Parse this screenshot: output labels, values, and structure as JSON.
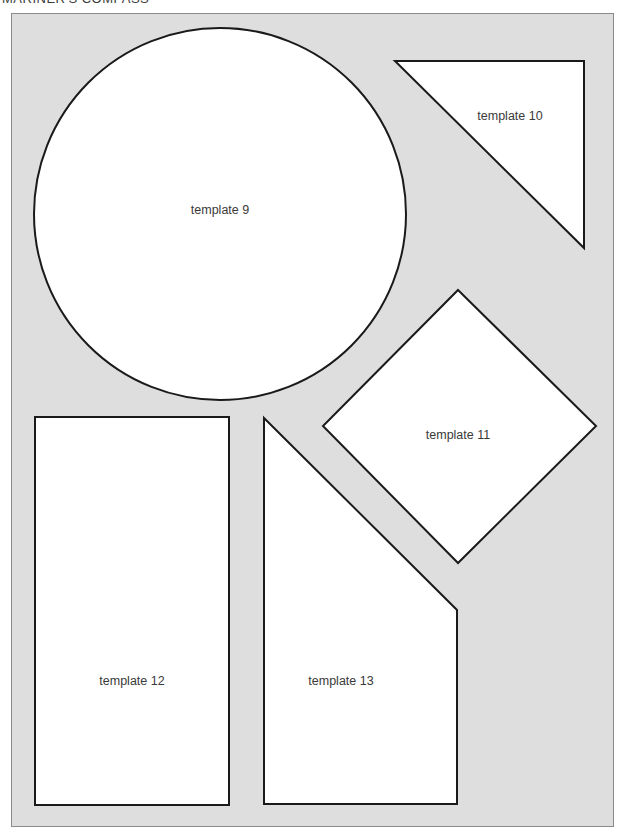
{
  "header": {
    "title": "MARINER'S COMPASS"
  },
  "colors": {
    "panel_background": "#dedede",
    "shape_fill": "#ffffff",
    "shape_stroke": "#1a1a1a",
    "label_text": "#3a3a3a"
  },
  "templates": [
    {
      "id": "template-9",
      "label": "template 9",
      "shape": "circle"
    },
    {
      "id": "template-10",
      "label": "template 10",
      "shape": "right-triangle"
    },
    {
      "id": "template-11",
      "label": "template 11",
      "shape": "diamond"
    },
    {
      "id": "template-12",
      "label": "template 12",
      "shape": "rectangle"
    },
    {
      "id": "template-13",
      "label": "template 13",
      "shape": "pentagon"
    }
  ]
}
